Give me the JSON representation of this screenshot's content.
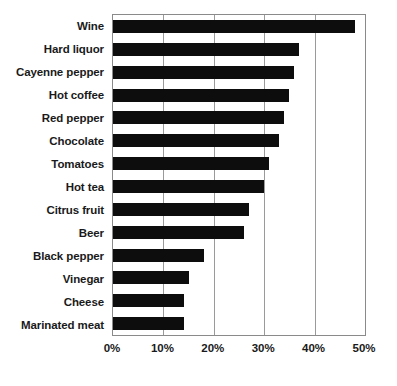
{
  "chart_data": {
    "type": "bar",
    "orientation": "horizontal",
    "title": "",
    "subtitle": "",
    "xlabel": "",
    "ylabel": "",
    "xlim": [
      0,
      50
    ],
    "ylim": null,
    "grid": true,
    "legend": null,
    "legend_position": "none",
    "x_tick_labels": [
      "0%",
      "10%",
      "20%",
      "30%",
      "40%",
      "50%"
    ],
    "x_tick_values": [
      0,
      10,
      20,
      30,
      40,
      50
    ],
    "categories": [
      "Wine",
      "Hard liquor",
      "Cayenne pepper",
      "Hot coffee",
      "Red pepper",
      "Chocolate",
      "Tomatoes",
      "Hot tea",
      "Citrus fruit",
      "Beer",
      "Black pepper",
      "Vinegar",
      "Cheese",
      "Marinated meat"
    ],
    "values": [
      48,
      37,
      36,
      35,
      34,
      33,
      31,
      30,
      27,
      26,
      18,
      15,
      14,
      14
    ],
    "value_unit": "%",
    "bar_color": "#0d0d0d",
    "grid_color": "#9a9a9a",
    "axis_color": "#8a8a8a",
    "background_color": "#ffffff"
  },
  "axis": {
    "x_ticks": [
      {
        "label": "0%",
        "value": 0
      },
      {
        "label": "10%",
        "value": 10
      },
      {
        "label": "20%",
        "value": 20
      },
      {
        "label": "30%",
        "value": 30
      },
      {
        "label": "40%",
        "value": 40
      },
      {
        "label": "50%",
        "value": 50
      }
    ]
  }
}
